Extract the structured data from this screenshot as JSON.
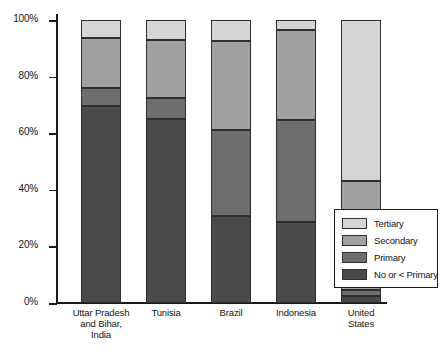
{
  "chart_data": {
    "type": "bar",
    "subtype": "stacked-bar-100-percent",
    "title": "",
    "xlabel": "",
    "ylabel": "",
    "ylim": [
      0,
      100
    ],
    "yticks": [
      0,
      20,
      40,
      60,
      80,
      100
    ],
    "ytick_labels": [
      "0%",
      "20%",
      "40%",
      "60%",
      "80%",
      "100%"
    ],
    "grid": false,
    "legend_position": "bottom-right",
    "categories": [
      "Uttar Pradesh and Bihar, India",
      "Tunisia",
      "Brazil",
      "Indonesia",
      "United States"
    ],
    "category_label_lines": [
      [
        "Uttar Pradesh",
        "and Bihar,",
        "India"
      ],
      [
        "Tunisia"
      ],
      [
        "Brazil"
      ],
      [
        "Indonesia"
      ],
      [
        "United",
        "States"
      ]
    ],
    "series": [
      {
        "name": "No or < Primary",
        "color": "#4a4a4a",
        "values": [
          69.5,
          65.0,
          30.7,
          28.5,
          2.5
        ]
      },
      {
        "name": "Primary",
        "color": "#6e6e6e",
        "values": [
          6.5,
          7.5,
          30.5,
          36.0,
          2.0
        ]
      },
      {
        "name": "Secondary",
        "color": "#a0a0a0",
        "values": [
          17.5,
          20.5,
          31.4,
          32.0,
          38.5
        ]
      },
      {
        "name": "Tertiary",
        "color": "#d5d5d5",
        "values": [
          6.5,
          7.0,
          7.4,
          3.5,
          57.0
        ]
      }
    ],
    "legend": [
      {
        "label": "Tertiary",
        "color": "#d5d5d5"
      },
      {
        "label": "Secondary",
        "color": "#a0a0a0"
      },
      {
        "label": "Primary",
        "color": "#6e6e6e"
      },
      {
        "label": "No or < Primary",
        "color": "#4a4a4a"
      }
    ]
  }
}
